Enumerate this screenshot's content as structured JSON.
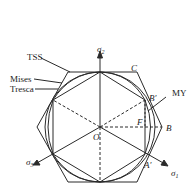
{
  "figure": {
    "type": "yield-criteria-pi-plane",
    "curves": [
      {
        "name": "TSS",
        "label": "TSS",
        "shape": "outer hexagon"
      },
      {
        "name": "Mises",
        "label": "Mises",
        "shape": "circle"
      },
      {
        "name": "Tresca",
        "label": "Tresca",
        "shape": "inner hexagon"
      },
      {
        "name": "MY",
        "label": "MY",
        "shape": "curved hexagon"
      }
    ],
    "axes": {
      "sigma1": {
        "symbol": "σ",
        "sub": "1"
      },
      "sigma2": {
        "symbol": "σ",
        "sub": "2"
      },
      "sigma3": {
        "symbol": "σ",
        "sub": "3"
      }
    },
    "points": {
      "origin": "O",
      "C": "C",
      "B": "B",
      "B_prime": "B′",
      "A_prime": "A′",
      "F": "F"
    },
    "colors": {
      "line": "#2a2a2a",
      "background": "#ffffff"
    }
  }
}
